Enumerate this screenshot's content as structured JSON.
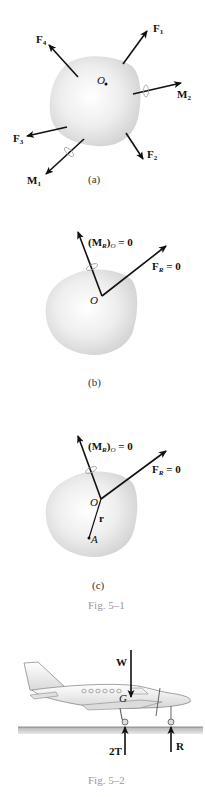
{
  "figure_5_1": {
    "panel_a": {
      "caption": "(a)",
      "point_label": "O",
      "forces": [
        {
          "name": "F",
          "sub": "1"
        },
        {
          "name": "F",
          "sub": "2"
        },
        {
          "name": "F",
          "sub": "3"
        },
        {
          "name": "F",
          "sub": "4"
        }
      ],
      "moments": [
        {
          "name": "M",
          "sub": "1"
        },
        {
          "name": "M",
          "sub": "2"
        }
      ]
    },
    "panel_b": {
      "caption": "(b)",
      "point_label": "O",
      "moment_label": {
        "open": "(M",
        "sub_r": "R",
        "close": ")",
        "sub_o": "O",
        "eq": " = 0"
      },
      "force_label": {
        "name": "F",
        "sub": "R",
        "eq": " = 0"
      }
    },
    "panel_c": {
      "caption": "(c)",
      "point_label": "O",
      "point_a_label": "A",
      "position_vector_label": "r",
      "moment_label": {
        "open": "(M",
        "sub_r": "R",
        "close": ")",
        "sub_o": "O",
        "eq": " = 0"
      },
      "force_label": {
        "name": "F",
        "sub": "R",
        "eq": " = 0"
      }
    },
    "title": "Fig. 5–1"
  },
  "figure_5_2": {
    "weight_label": "W",
    "cg_label": "G",
    "main_gear_label": "2T",
    "nose_gear_label": "R",
    "title": "Fig. 5–2"
  },
  "colors": {
    "arrow": "#111111",
    "blob": "#d8d8d8",
    "caption_fig": "#9a9a9a",
    "ground": "#a8a8a8"
  }
}
